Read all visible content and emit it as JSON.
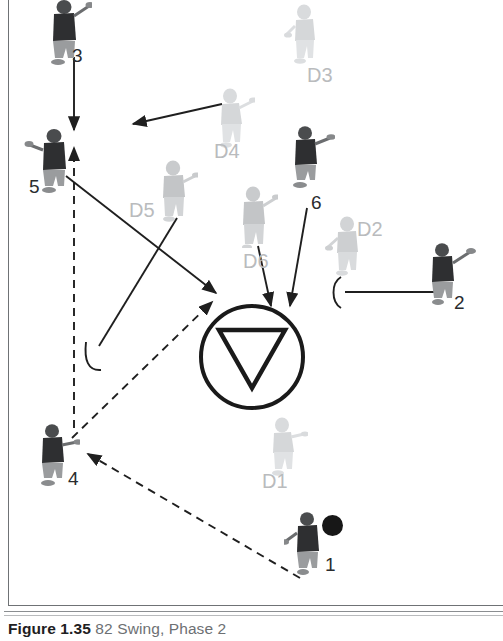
{
  "figure": {
    "number": "Figure 1.35",
    "title": "82 Swing, Phase 2",
    "domain_kind": "lacrosse-play-diagram"
  },
  "colors": {
    "offense_jersey": "#2e2f31",
    "offense_shorts": "#9a9c9e",
    "defense": "#d5d7d9",
    "line": "#262626",
    "frame": "#6f7275",
    "ball": "#171717",
    "label_offense": "#2a2c2e",
    "label_defense": "#b9bbbd"
  },
  "goal": {
    "name": "goal-crease",
    "center_x": 252,
    "center_y": 357,
    "radius": 52,
    "marker": "inverted-triangle"
  },
  "offense_players": [
    {
      "id": "3",
      "label": "3",
      "x": 52,
      "y": 2,
      "label_x": 72,
      "label_y": 50,
      "has_ball": false
    },
    {
      "id": "5",
      "label": "5",
      "x": 30,
      "y": 130,
      "label_x": 31,
      "label_y": 183,
      "has_ball": false
    },
    {
      "id": "4",
      "label": "4",
      "x": 33,
      "y": 425,
      "label_x": 70,
      "label_y": 475,
      "has_ball": false
    },
    {
      "id": "6",
      "label": "6",
      "x": 285,
      "y": 128,
      "label_x": 311,
      "label_y": 198,
      "has_ball": false
    },
    {
      "id": "2",
      "label": "2",
      "x": 424,
      "y": 245,
      "label_x": 455,
      "label_y": 298,
      "has_ball": false
    },
    {
      "id": "1",
      "label": "1",
      "x": 288,
      "y": 513,
      "label_x": 325,
      "label_y": 560,
      "has_ball": true
    }
  ],
  "defense_players": [
    {
      "id": "D3",
      "label": "D3",
      "x": 283,
      "y": 4,
      "label_x": 307,
      "label_y": 70
    },
    {
      "id": "D4",
      "label": "D4",
      "x": 209,
      "y": 88,
      "label_x": 214,
      "label_y": 146
    },
    {
      "id": "D5",
      "label": "D5",
      "x": 152,
      "y": 160,
      "label_x": 129,
      "label_y": 205
    },
    {
      "id": "D6",
      "label": "D6",
      "x": 232,
      "y": 186,
      "label_x": 243,
      "label_y": 256
    },
    {
      "id": "D2",
      "label": "D2",
      "x": 325,
      "y": 215,
      "label_x": 360,
      "label_y": 224
    },
    {
      "id": "D1",
      "label": "D1",
      "x": 262,
      "y": 417,
      "label_x": 262,
      "label_y": 478
    }
  ],
  "ball": {
    "name": "ball",
    "x": 322,
    "y": 515,
    "diameter": 21
  },
  "movements": [
    {
      "name": "cut-3-to-5",
      "style": "solid",
      "kind": "arrow",
      "from": [
        74,
        57
      ],
      "to": [
        74,
        132
      ]
    },
    {
      "name": "cut-d4-left",
      "style": "solid",
      "kind": "arrow",
      "from": [
        222,
        104
      ],
      "to": [
        130,
        125
      ]
    },
    {
      "name": "cut-5-to-crease",
      "style": "solid",
      "kind": "arrow",
      "from": [
        66,
        176
      ],
      "to": [
        219,
        295
      ]
    },
    {
      "name": "screen-line-to-d5",
      "style": "solid",
      "kind": "hook",
      "from": [
        88,
        362
      ],
      "to": [
        177,
        218
      ]
    },
    {
      "name": "cut-d6-to-goal",
      "style": "solid",
      "kind": "arrow",
      "from": [
        262,
        245
      ],
      "to": [
        278,
        308
      ]
    },
    {
      "name": "cut-6-to-goal",
      "style": "solid",
      "kind": "arrow",
      "from": [
        305,
        207
      ],
      "to": [
        290,
        308
      ]
    },
    {
      "name": "screen-line-to-2",
      "style": "solid",
      "kind": "hook",
      "from": [
        338,
        293
      ],
      "to": [
        444,
        293
      ]
    },
    {
      "name": "pass-1-to-4",
      "style": "dashed",
      "kind": "arrow",
      "from": [
        300,
        578
      ],
      "to": [
        84,
        452
      ]
    },
    {
      "name": "pass-4-to-crease",
      "style": "dashed",
      "kind": "arrow",
      "from": [
        70,
        438
      ],
      "to": [
        215,
        300
      ]
    },
    {
      "name": "pass-4-to-5",
      "style": "dashed",
      "kind": "arrow",
      "from": [
        74,
        430
      ],
      "to": [
        74,
        145
      ]
    }
  ]
}
